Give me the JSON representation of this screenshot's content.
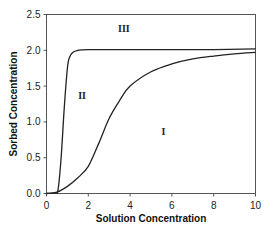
{
  "chart_data": {
    "type": "line",
    "title": "",
    "xlabel": "Solution  Concentration",
    "ylabel": "Sorbed Concentration",
    "xlim": [
      0,
      10
    ],
    "ylim": [
      0,
      2.5
    ],
    "xticks": [
      "0",
      "2",
      "4",
      "6",
      "8",
      "10"
    ],
    "yticks": [
      "0.0",
      "0.5",
      "1.0",
      "1.5",
      "2.0",
      "2.5"
    ],
    "grid": false,
    "legend": null,
    "series": [
      {
        "name": "Curve I (gradual sigmoidal)",
        "x": [
          0,
          0.5,
          1.0,
          1.5,
          2.0,
          2.5,
          3.0,
          3.5,
          4.0,
          5.0,
          6.0,
          7.0,
          8.0,
          9.0,
          10.0
        ],
        "y": [
          0,
          0.02,
          0.1,
          0.22,
          0.38,
          0.7,
          1.05,
          1.3,
          1.5,
          1.7,
          1.81,
          1.88,
          1.92,
          1.95,
          1.97
        ]
      },
      {
        "name": "Curve II (steep sigmoidal)",
        "x": [
          0,
          0.4,
          0.55,
          0.7,
          0.85,
          1.0,
          1.1,
          1.25,
          1.5,
          2.0,
          4.0,
          6.0,
          8.0,
          10.0
        ],
        "y": [
          0,
          0.01,
          0.05,
          0.5,
          1.2,
          1.75,
          1.9,
          1.97,
          2.0,
          2.01,
          2.01,
          2.01,
          2.01,
          2.02
        ]
      }
    ],
    "annotations": [
      {
        "text": "III",
        "x": 3.7,
        "y": 2.3
      },
      {
        "text": "II",
        "x": 1.7,
        "y": 1.37
      },
      {
        "text": "I",
        "x": 5.6,
        "y": 0.87
      }
    ]
  }
}
